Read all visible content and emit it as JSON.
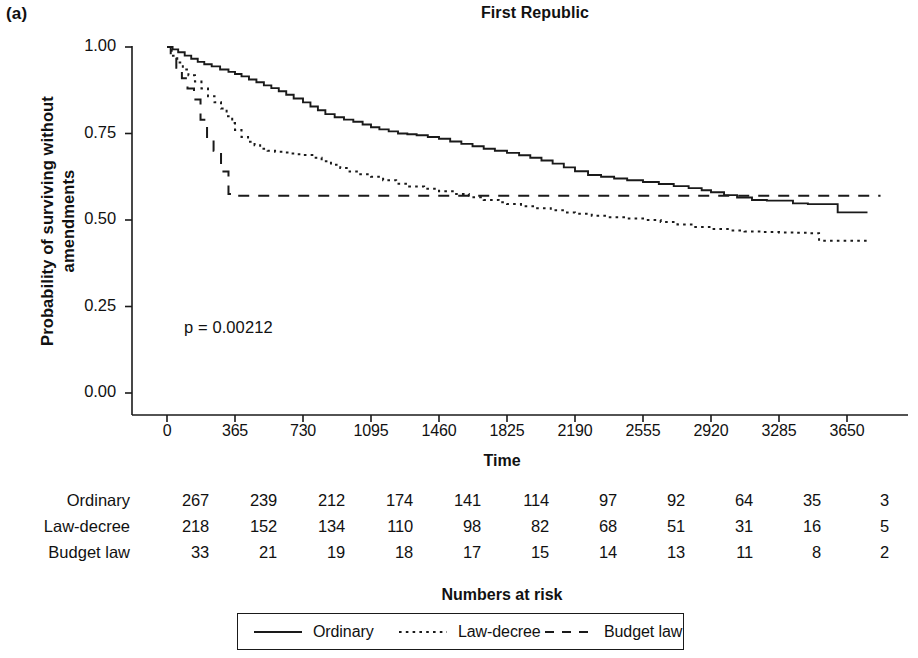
{
  "panel": {
    "label": "(a)"
  },
  "chart_data": {
    "type": "line",
    "subtype": "kaplan-meier-survival",
    "title": "First Republic",
    "xlabel": "Time",
    "ylabel_line1": "Probability of surviving without",
    "ylabel_line2": "amendments",
    "annotation": "p = 0.00212",
    "xlim": [
      0,
      3830
    ],
    "ylim": [
      0.0,
      1.05
    ],
    "grid": false,
    "legend_position": "bottom",
    "xticks": [
      0,
      365,
      730,
      1095,
      1460,
      1825,
      2190,
      2555,
      2920,
      3285,
      3650
    ],
    "xtick_labels": [
      "0",
      "365",
      "730",
      "1095",
      "1460",
      "1825",
      "2190",
      "2555",
      "2920",
      "3285",
      "3650"
    ],
    "yticks": [
      0.0,
      0.25,
      0.5,
      0.75,
      1.0
    ],
    "ytick_labels": [
      "0.00",
      "0.25",
      "0.50",
      "0.75",
      "1.00"
    ],
    "series": [
      {
        "name": "Ordinary",
        "style": "solid",
        "color": "#1a1a1a",
        "x": [
          0,
          30,
          60,
          95,
          130,
          165,
          200,
          240,
          285,
          330,
          365,
          400,
          440,
          480,
          520,
          560,
          600,
          640,
          680,
          730,
          770,
          810,
          850,
          900,
          950,
          1000,
          1050,
          1095,
          1140,
          1190,
          1240,
          1290,
          1340,
          1400,
          1460,
          1520,
          1580,
          1640,
          1700,
          1760,
          1825,
          1890,
          1950,
          2010,
          2070,
          2130,
          2190,
          2260,
          2330,
          2400,
          2470,
          2555,
          2640,
          2720,
          2800,
          2870,
          2920,
          2990,
          3060,
          3140,
          3220,
          3285,
          3360,
          3440,
          3520,
          3600,
          3650,
          3760
        ],
        "y": [
          1.0,
          0.993,
          0.985,
          0.975,
          0.966,
          0.957,
          0.95,
          0.944,
          0.935,
          0.928,
          0.922,
          0.915,
          0.906,
          0.898,
          0.889,
          0.881,
          0.872,
          0.862,
          0.851,
          0.84,
          0.828,
          0.817,
          0.806,
          0.797,
          0.79,
          0.784,
          0.776,
          0.768,
          0.762,
          0.756,
          0.75,
          0.748,
          0.745,
          0.74,
          0.735,
          0.727,
          0.72,
          0.713,
          0.706,
          0.7,
          0.694,
          0.687,
          0.68,
          0.672,
          0.663,
          0.652,
          0.641,
          0.63,
          0.625,
          0.62,
          0.615,
          0.61,
          0.604,
          0.598,
          0.592,
          0.586,
          0.58,
          0.572,
          0.565,
          0.558,
          0.556,
          0.556,
          0.548,
          0.546,
          0.546,
          0.522,
          0.522,
          0.522
        ]
      },
      {
        "name": "Law-decree",
        "style": "dotted",
        "color": "#1a1a1a",
        "x": [
          0,
          25,
          55,
          85,
          115,
          150,
          185,
          220,
          255,
          290,
          320,
          350,
          365,
          400,
          435,
          470,
          500,
          540,
          580,
          620,
          660,
          700,
          730,
          780,
          830,
          880,
          930,
          980,
          1030,
          1095,
          1160,
          1230,
          1300,
          1380,
          1460,
          1540,
          1620,
          1700,
          1780,
          1825,
          1900,
          1980,
          2060,
          2140,
          2190,
          2280,
          2370,
          2460,
          2555,
          2650,
          2740,
          2830,
          2920,
          3010,
          3100,
          3190,
          3285,
          3380,
          3440,
          3500,
          3600,
          3650,
          3760
        ],
        "y": [
          1.0,
          0.975,
          0.955,
          0.935,
          0.918,
          0.9,
          0.88,
          0.858,
          0.84,
          0.822,
          0.8,
          0.78,
          0.76,
          0.74,
          0.726,
          0.716,
          0.706,
          0.7,
          0.697,
          0.695,
          0.692,
          0.69,
          0.688,
          0.68,
          0.67,
          0.66,
          0.65,
          0.64,
          0.632,
          0.625,
          0.615,
          0.605,
          0.597,
          0.59,
          0.583,
          0.575,
          0.566,
          0.558,
          0.551,
          0.546,
          0.54,
          0.534,
          0.528,
          0.522,
          0.518,
          0.512,
          0.508,
          0.504,
          0.5,
          0.494,
          0.487,
          0.48,
          0.474,
          0.47,
          0.467,
          0.465,
          0.464,
          0.463,
          0.462,
          0.44,
          0.44,
          0.44,
          0.44
        ]
      },
      {
        "name": "Budget law",
        "style": "dashed",
        "color": "#1a1a1a",
        "x": [
          0,
          20,
          20,
          50,
          50,
          80,
          80,
          110,
          110,
          145,
          145,
          180,
          180,
          215,
          215,
          250,
          250,
          290,
          290,
          330,
          330,
          365,
          365,
          3830
        ],
        "y": [
          1.0,
          1.0,
          0.97,
          0.97,
          0.94,
          0.94,
          0.91,
          0.91,
          0.88,
          0.88,
          0.848,
          0.848,
          0.79,
          0.79,
          0.73,
          0.73,
          0.7,
          0.7,
          0.64,
          0.64,
          0.575,
          0.575,
          0.57,
          0.57
        ]
      }
    ]
  },
  "risk_table": {
    "caption": "Numbers at risk",
    "columns": [
      "0",
      "365",
      "730",
      "1095",
      "1460",
      "1825",
      "2190",
      "2555",
      "2920",
      "3285",
      "3650"
    ],
    "rows": [
      {
        "label": "Ordinary",
        "values": [
          "267",
          "239",
          "212",
          "174",
          "141",
          "114",
          "97",
          "92",
          "64",
          "35",
          "3"
        ]
      },
      {
        "label": "Law-decree",
        "values": [
          "218",
          "152",
          "134",
          "110",
          "98",
          "82",
          "68",
          "51",
          "31",
          "16",
          "5"
        ]
      },
      {
        "label": "Budget law",
        "values": [
          "33",
          "21",
          "19",
          "18",
          "17",
          "15",
          "14",
          "13",
          "11",
          "8",
          "2"
        ]
      }
    ]
  },
  "legend": {
    "items": [
      {
        "label": "Ordinary",
        "style": "solid"
      },
      {
        "label": "Law-decree",
        "style": "dotted"
      },
      {
        "label": "Budget law",
        "style": "dashed"
      }
    ]
  },
  "colors": {
    "ink": "#1a1a1a",
    "background": "#ffffff"
  }
}
